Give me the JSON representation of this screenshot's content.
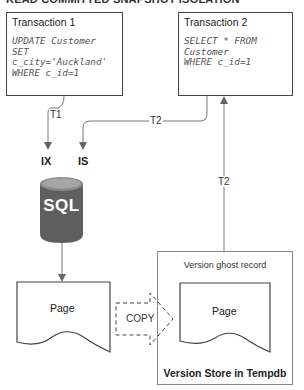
{
  "title": "READ COMMITTED SNAPSHOT ISOLATION",
  "transaction1": {
    "title": "Transaction 1",
    "code": "UPDATE Customer\nSET\nc_city='Auckland'\nWHERE c_id=1"
  },
  "transaction2": {
    "title": "Transaction 2",
    "code": "SELECT * FROM\nCustomer\nWHERE c_id=1"
  },
  "edges": {
    "t1_label": "T1",
    "t2_label": "T2",
    "t2_return_label": "T2"
  },
  "locks": {
    "ix": "IX",
    "is": "IS"
  },
  "database": {
    "label": "SQL",
    "icon": "database-cylinder-icon",
    "colors": {
      "body": "#5f5f5f",
      "top": "#9a9a9a",
      "text": "#ffffff"
    }
  },
  "page": {
    "label": "Page"
  },
  "copy": {
    "label": "COPY"
  },
  "version_store": {
    "ghost_label": "Version ghost record",
    "page_label": "Page",
    "title": "Version Store in Tempdb"
  }
}
